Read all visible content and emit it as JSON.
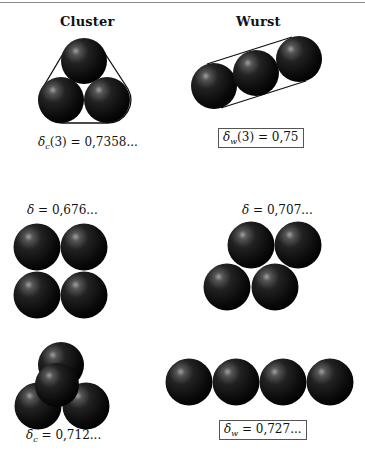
{
  "columns": {
    "left": {
      "header": "Cluster"
    },
    "right": {
      "header": "Wurst"
    }
  },
  "panels": {
    "cluster3": {
      "description": "three spheres in triangular cluster with convex hull outline",
      "label": {
        "symbol": "δ",
        "sub": "c",
        "arg": "(3)",
        "eq": " = ",
        "value": "0,7358..."
      },
      "boxed": false
    },
    "wurst3": {
      "description": "three spheres in a line (sausage) with convex hull outline",
      "label": {
        "symbol": "δ",
        "sub": "w",
        "arg": "(3)",
        "eq": " = ",
        "value": "0,75"
      },
      "boxed": true
    },
    "square4": {
      "description": "four spheres in square arrangement",
      "label": {
        "symbol": "δ",
        "sub": "",
        "arg": "",
        "eq": " = ",
        "value": "0,676..."
      },
      "boxed": false
    },
    "rhombus4": {
      "description": "four spheres in rhombus arrangement",
      "label": {
        "symbol": "δ",
        "sub": "",
        "arg": "",
        "eq": " = ",
        "value": "0,707..."
      },
      "boxed": false
    },
    "tetra4": {
      "description": "four spheres in tetrahedral cluster",
      "label": {
        "symbol": "δ",
        "sub": "c",
        "arg": "",
        "eq": " = ",
        "value": "0,712..."
      },
      "boxed": false
    },
    "line4": {
      "description": "four spheres in a straight line (sausage)",
      "label": {
        "symbol": "δ",
        "sub": "w",
        "arg": "",
        "eq": " = ",
        "value": "0,727..."
      },
      "boxed": true
    }
  },
  "colors": {
    "sphere_dark": "#050505",
    "sphere_mid": "#2a2a2a",
    "sphere_highlight": "#9a9a9a",
    "hull_line": "#111111",
    "top_rule": "#8a8a8a"
  }
}
